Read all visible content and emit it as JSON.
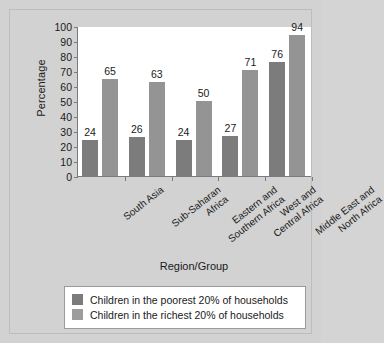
{
  "chart_data": {
    "type": "bar",
    "title": "",
    "xlabel": "Region/Group",
    "ylabel": "Percentage",
    "categories": [
      "South Asia",
      "Sub-Saharan Africa",
      "Eastern and Southern Africa",
      "West and Central Africa",
      "Middle East and North Africa"
    ],
    "category_lines": [
      [
        "South Asia"
      ],
      [
        "Sub-Saharan",
        "Africa"
      ],
      [
        "Eastern and",
        "Southern Africa"
      ],
      [
        "West and",
        "Central Africa"
      ],
      [
        "Middle East and",
        "North Africa"
      ]
    ],
    "series": [
      {
        "name": "Children in the poorest 20% of households",
        "color": "#7c7c7c",
        "values": [
          24,
          26,
          24,
          27,
          76
        ]
      },
      {
        "name": "Children in the richest 20% of households",
        "color": "#949494",
        "values": [
          65,
          63,
          50,
          71,
          94
        ]
      }
    ],
    "ylim": [
      0,
      100
    ],
    "yticks": [
      0,
      10,
      20,
      30,
      40,
      50,
      60,
      70,
      80,
      90,
      100
    ],
    "grid": false,
    "legend_position": "bottom"
  },
  "legend": {
    "entries": [
      "Children in the poorest 20% of households",
      "Children in the richest 20% of households"
    ]
  },
  "colors": {
    "poorest": "#7c7c7c",
    "richest": "#949494",
    "background": "#d2d2d2",
    "plot_background": "#ffffff",
    "axis": "#7a7a7a"
  }
}
